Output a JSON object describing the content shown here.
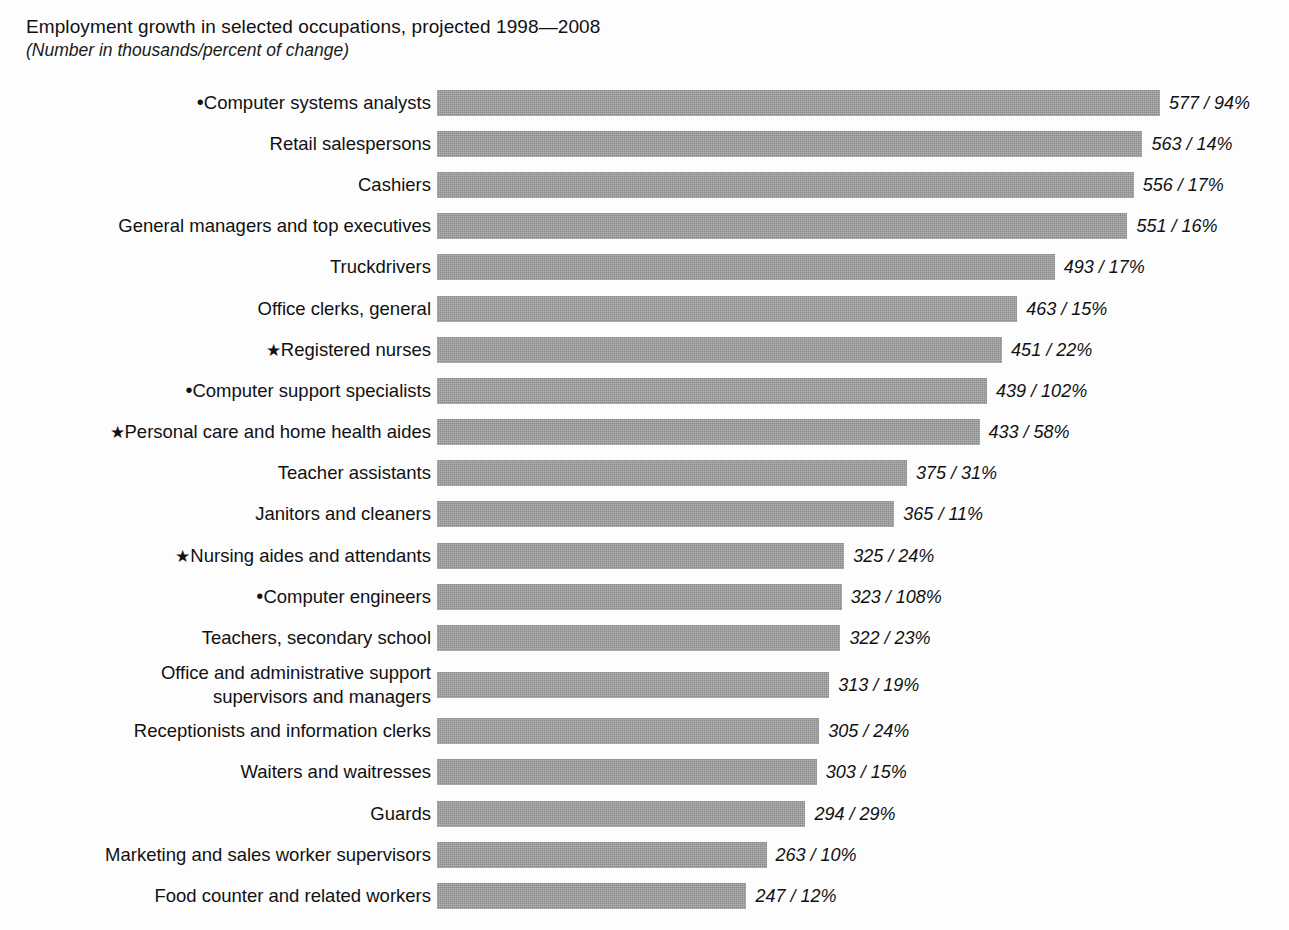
{
  "header": {
    "title": "Employment growth in selected occupations, projected 1998—2008",
    "subtitle": "(Number in thousands/percent of change)"
  },
  "style": {
    "bar_color": "#8b8b8b",
    "background": "#fdfdfd",
    "text_color": "#111111"
  },
  "markers": {
    "dot": "•",
    "star": "★"
  },
  "chart_data": {
    "type": "bar",
    "orientation": "horizontal",
    "title": "Employment growth in selected occupations, projected 1998—2008",
    "subtitle": "(Number in thousands/percent of change)",
    "xlabel": "",
    "ylabel": "",
    "grid": false,
    "legend": "none",
    "axis_visible": false,
    "value_unit": "thousands",
    "xlim": [
      0,
      577
    ],
    "categories": [
      "Computer systems analysts",
      "Retail salespersons",
      "Cashiers",
      "General managers and top executives",
      "Truckdrivers",
      "Office clerks, general",
      "Registered nurses",
      "Computer support specialists",
      "Personal care and home health aides",
      "Teacher assistants",
      "Janitors and cleaners",
      "Nursing aides and attendants",
      "Computer engineers",
      "Teachers, secondary school",
      "Office and administrative support\nsupervisors and managers",
      "Receptionists and information clerks",
      "Waiters and waitresses",
      "Guards",
      "Marketing and sales worker supervisors",
      "Food counter and related workers"
    ],
    "values": [
      577,
      563,
      556,
      551,
      493,
      463,
      451,
      439,
      433,
      375,
      365,
      325,
      323,
      322,
      313,
      305,
      303,
      294,
      263,
      247
    ],
    "percent_change": [
      94,
      14,
      17,
      16,
      17,
      15,
      22,
      102,
      58,
      31,
      11,
      24,
      108,
      23,
      19,
      24,
      15,
      29,
      10,
      12
    ],
    "data_labels": [
      "577 / 94%",
      "563 / 14%",
      "556 / 17%",
      "551 / 16%",
      "493 / 17%",
      "463 / 15%",
      "451 / 22%",
      "439 / 102%",
      "433 / 58%",
      "375 / 31%",
      "365 / 11%",
      "325 / 24%",
      "323 / 108%",
      "322 / 23%",
      "313 / 19%",
      "305 / 24%",
      "303 / 15%",
      "294 / 29%",
      "263 / 10%",
      "247 / 12%"
    ],
    "marker_symbols": [
      "•",
      "",
      "",
      "",
      "",
      "",
      "★",
      "•",
      "★",
      "",
      "",
      "★",
      "•",
      "",
      "",
      "",
      "",
      "",
      "",
      ""
    ]
  },
  "rows": [
    {
      "label": "Computer systems analysts",
      "marker": "•",
      "marker_type": "dot",
      "value": 577,
      "value_label": "577 / 94%",
      "tall": false
    },
    {
      "label": "Retail salespersons",
      "marker": "",
      "marker_type": "",
      "value": 563,
      "value_label": "563 / 14%",
      "tall": false
    },
    {
      "label": "Cashiers",
      "marker": "",
      "marker_type": "",
      "value": 556,
      "value_label": "556 / 17%",
      "tall": false
    },
    {
      "label": "General managers and top executives",
      "marker": "",
      "marker_type": "",
      "value": 551,
      "value_label": "551 / 16%",
      "tall": false
    },
    {
      "label": "Truckdrivers",
      "marker": "",
      "marker_type": "",
      "value": 493,
      "value_label": "493 / 17%",
      "tall": false
    },
    {
      "label": "Office clerks, general",
      "marker": "",
      "marker_type": "",
      "value": 463,
      "value_label": "463 / 15%",
      "tall": false
    },
    {
      "label": "Registered nurses",
      "marker": "★",
      "marker_type": "star",
      "value": 451,
      "value_label": "451 / 22%",
      "tall": false
    },
    {
      "label": "Computer support specialists",
      "marker": "•",
      "marker_type": "dot",
      "value": 439,
      "value_label": "439 / 102%",
      "tall": false
    },
    {
      "label": "Personal care and home health aides",
      "marker": "★",
      "marker_type": "star",
      "value": 433,
      "value_label": "433 / 58%",
      "tall": false
    },
    {
      "label": "Teacher assistants",
      "marker": "",
      "marker_type": "",
      "value": 375,
      "value_label": "375 / 31%",
      "tall": false
    },
    {
      "label": "Janitors and cleaners",
      "marker": "",
      "marker_type": "",
      "value": 365,
      "value_label": "365 / 11%",
      "tall": false
    },
    {
      "label": "Nursing aides and attendants",
      "marker": "★",
      "marker_type": "star",
      "value": 325,
      "value_label": "325 / 24%",
      "tall": false
    },
    {
      "label": "Computer engineers",
      "marker": "•",
      "marker_type": "dot",
      "value": 323,
      "value_label": "323 / 108%",
      "tall": false
    },
    {
      "label": "Teachers, secondary school",
      "marker": "",
      "marker_type": "",
      "value": 322,
      "value_label": "322 / 23%",
      "tall": false
    },
    {
      "label": "Office and administrative support\nsupervisors and managers",
      "marker": "",
      "marker_type": "",
      "value": 313,
      "value_label": "313 / 19%",
      "tall": true
    },
    {
      "label": "Receptionists and information clerks",
      "marker": "",
      "marker_type": "",
      "value": 305,
      "value_label": "305 / 24%",
      "tall": false
    },
    {
      "label": "Waiters and waitresses",
      "marker": "",
      "marker_type": "",
      "value": 303,
      "value_label": "303 / 15%",
      "tall": false
    },
    {
      "label": "Guards",
      "marker": "",
      "marker_type": "",
      "value": 294,
      "value_label": "294 / 29%",
      "tall": false
    },
    {
      "label": "Marketing and sales worker supervisors",
      "marker": "",
      "marker_type": "",
      "value": 263,
      "value_label": "263 / 10%",
      "tall": false
    },
    {
      "label": "Food counter and related workers",
      "marker": "",
      "marker_type": "",
      "value": 247,
      "value_label": "247 / 12%",
      "tall": false
    }
  ]
}
